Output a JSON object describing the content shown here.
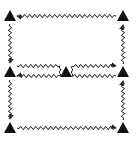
{
  "diagram": {
    "type": "directed-graph",
    "colors": {
      "stroke": "#222222",
      "node": "#111111",
      "background": "#ffffff"
    },
    "nodes": [
      {
        "id": "TL",
        "x": 10,
        "y": 16,
        "shape": "triangle"
      },
      {
        "id": "TR",
        "x": 123,
        "y": 16,
        "shape": "triangle"
      },
      {
        "id": "ML",
        "x": 10,
        "y": 72,
        "shape": "triangle"
      },
      {
        "id": "MC",
        "x": 66,
        "y": 72,
        "shape": "triangle"
      },
      {
        "id": "MR",
        "x": 123,
        "y": 72,
        "shape": "triangle"
      },
      {
        "id": "BL",
        "x": 10,
        "y": 128,
        "shape": "triangle"
      },
      {
        "id": "BR",
        "x": 123,
        "y": 128,
        "shape": "triangle"
      }
    ],
    "edges": [
      {
        "from": "TR",
        "to": "TL",
        "style": "wavy"
      },
      {
        "from": "TL",
        "to": "ML",
        "style": "wavy"
      },
      {
        "from": "MR",
        "to": "TR",
        "style": "wavy"
      },
      {
        "from": "ML",
        "to": "MC",
        "style": "wavy",
        "lane": "upper"
      },
      {
        "from": "MC",
        "to": "MR",
        "style": "wavy",
        "lane": "upper"
      },
      {
        "from": "MR",
        "to": "MC",
        "style": "wavy",
        "lane": "lower"
      },
      {
        "from": "MC",
        "to": "ML",
        "style": "wavy",
        "lane": "lower"
      },
      {
        "from": "ML",
        "to": "BL",
        "style": "wavy"
      },
      {
        "from": "BL",
        "to": "BR",
        "style": "wavy"
      },
      {
        "from": "BR",
        "to": "MR",
        "style": "wavy"
      }
    ]
  }
}
